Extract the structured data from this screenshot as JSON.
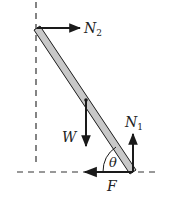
{
  "diagram": {
    "type": "free-body diagram",
    "labels": {
      "n2": "N",
      "n2_sub": "2",
      "weight": "W",
      "n1": "N",
      "n1_sub": "1",
      "friction": "F",
      "angle": "θ"
    },
    "colors": {
      "ladder_fill": "#c8c8c8",
      "ink": "#1a1a1a",
      "dash": "#333333",
      "background": "#ffffff"
    },
    "geometry": {
      "wall_x": 36,
      "ground_y": 172,
      "ladder_top": [
        37,
        28
      ],
      "ladder_bottom": [
        133,
        172
      ],
      "center_of_mass": [
        85,
        100
      ]
    }
  }
}
